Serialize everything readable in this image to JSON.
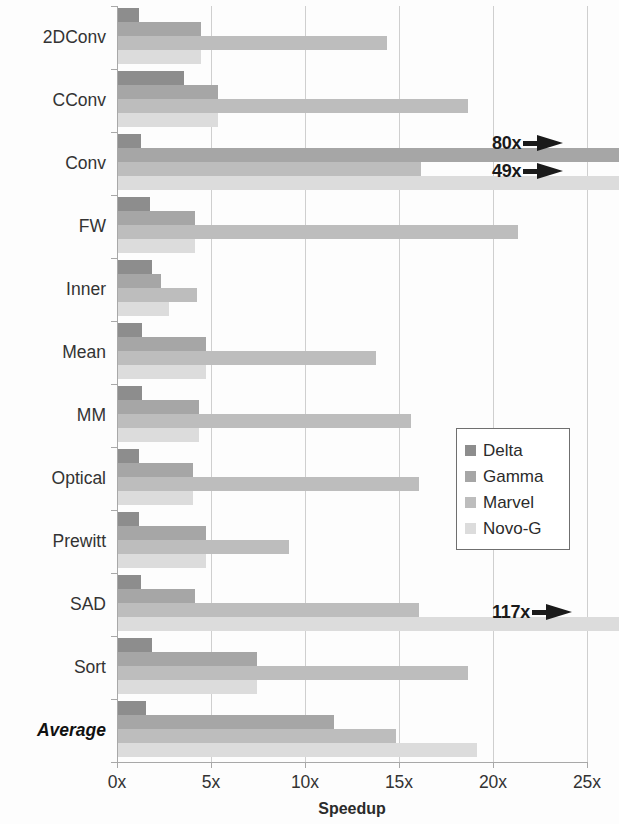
{
  "chart_data": {
    "type": "bar",
    "orientation": "horizontal",
    "title": "",
    "xlabel": "Speedup",
    "ylabel": "",
    "xlim": [
      0,
      25
    ],
    "xticks": [
      "0x",
      "5x",
      "10x",
      "15x",
      "20x",
      "25x"
    ],
    "xtick_values": [
      0,
      5,
      10,
      15,
      20,
      25
    ],
    "grid": true,
    "legend_position": "center-right",
    "categories": [
      "2DConv",
      "CConv",
      "Conv",
      "FW",
      "Inner",
      "Mean",
      "MM",
      "Optical",
      "Prewitt",
      "SAD",
      "Sort",
      "Average"
    ],
    "series": [
      {
        "name": "Delta",
        "color": "#8d8d8d",
        "values": [
          1.1,
          3.5,
          1.2,
          1.7,
          1.8,
          1.3,
          1.3,
          1.1,
          1.1,
          1.2,
          1.8,
          1.5
        ]
      },
      {
        "name": "Gamma",
        "color": "#a6a6a6",
        "values": [
          4.4,
          5.3,
          80.0,
          4.1,
          2.3,
          4.7,
          4.3,
          4.0,
          4.7,
          4.1,
          7.4,
          11.5
        ]
      },
      {
        "name": "Marvel",
        "color": "#bdbdbd",
        "values": [
          14.3,
          18.6,
          16.1,
          21.3,
          4.2,
          13.7,
          15.6,
          16.0,
          9.1,
          16.0,
          18.6,
          14.8
        ]
      },
      {
        "name": "Novo-G",
        "color": "#dcdcdc",
        "values": [
          4.4,
          5.3,
          49.0,
          4.1,
          2.7,
          4.7,
          4.3,
          4.0,
          4.7,
          117.0,
          7.4,
          19.1
        ]
      }
    ],
    "annotations": [
      {
        "label": "80x",
        "category": "Conv",
        "series": "Gamma"
      },
      {
        "label": "49x",
        "category": "Conv",
        "series": "Novo-G"
      },
      {
        "label": "117x",
        "category": "SAD",
        "series": "Novo-G"
      }
    ]
  },
  "legend": {
    "items": [
      {
        "label": "Delta",
        "swatch_class": "delta"
      },
      {
        "label": "Gamma",
        "swatch_class": "gamma"
      },
      {
        "label": "Marvel",
        "swatch_class": "marvel"
      },
      {
        "label": "Novo-G",
        "swatch_class": "novog"
      }
    ]
  }
}
